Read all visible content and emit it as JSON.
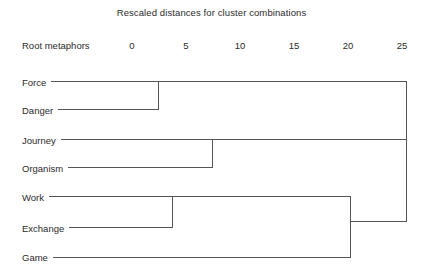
{
  "chart_data": {
    "type": "dendrogram",
    "title": "Rescaled distances for cluster combinations",
    "axis_caption": "Root metaphors",
    "xlabel": "Rescaled distance",
    "ylabel": "Root metaphors",
    "xlim": [
      0,
      25
    ],
    "grid": false,
    "legend": "none",
    "ticks": [
      {
        "label": "0",
        "value": 0
      },
      {
        "label": "5",
        "value": 5
      },
      {
        "label": "10",
        "value": 10
      },
      {
        "label": "15",
        "value": 15
      },
      {
        "label": "20",
        "value": 20
      },
      {
        "label": "25",
        "value": 25
      }
    ],
    "leaves": [
      {
        "label": "Force",
        "order": 0
      },
      {
        "label": "Danger",
        "order": 1
      },
      {
        "label": "Journey",
        "order": 2
      },
      {
        "label": "Organism",
        "order": 3
      },
      {
        "label": "Work",
        "order": 4
      },
      {
        "label": "Exchange",
        "order": 5
      },
      {
        "label": "Game",
        "order": 6
      }
    ],
    "merges": [
      {
        "name": "force-danger",
        "members": [
          "Force",
          "Danger"
        ],
        "distance": 2.4
      },
      {
        "name": "work-exchange",
        "members": [
          "Work",
          "Exchange"
        ],
        "distance": 3.7
      },
      {
        "name": "journey-organism",
        "members": [
          "Journey",
          "Organism"
        ],
        "distance": 7.4
      },
      {
        "name": "workexchange-game",
        "members": [
          "Work",
          "Exchange",
          "Game"
        ],
        "distance": 20.2
      },
      {
        "name": "root",
        "members": [
          "Force",
          "Danger",
          "Journey",
          "Organism",
          "Work",
          "Exchange",
          "Game"
        ],
        "distance": 25.0
      }
    ]
  },
  "colors": {
    "line": "#555555",
    "text": "#2b2b2b",
    "background": "#ffffff"
  }
}
